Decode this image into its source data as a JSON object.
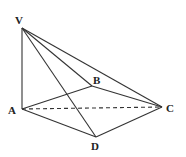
{
  "diagram": {
    "type": "pyramid",
    "points": {
      "V": {
        "label": "V",
        "x": 22,
        "y": 28,
        "lx": 15,
        "ly": 24
      },
      "A": {
        "label": "A",
        "x": 22,
        "y": 109,
        "lx": 8,
        "ly": 114
      },
      "B": {
        "label": "B",
        "x": 92,
        "y": 86,
        "lx": 93,
        "ly": 84
      },
      "C": {
        "label": "C",
        "x": 162,
        "y": 107,
        "lx": 166,
        "ly": 112
      },
      "D": {
        "label": "D",
        "x": 96,
        "y": 137,
        "lx": 91,
        "ly": 150
      }
    },
    "solid_edges": [
      [
        "V",
        "A"
      ],
      [
        "V",
        "B"
      ],
      [
        "V",
        "C"
      ],
      [
        "V",
        "D"
      ],
      [
        "A",
        "B"
      ],
      [
        "B",
        "C"
      ],
      [
        "A",
        "D"
      ],
      [
        "D",
        "C"
      ]
    ],
    "dashed_edges": [
      [
        "A",
        "C"
      ]
    ]
  }
}
